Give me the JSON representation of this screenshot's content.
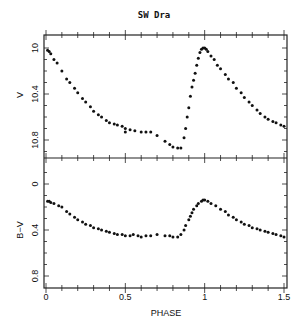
{
  "chart_data": [
    {
      "type": "scatter",
      "title": "SW Dra",
      "xlabel": "PHASE",
      "ylabel": "V",
      "xlim": [
        0,
        1.5
      ],
      "ylim": [
        10.9,
        9.95
      ],
      "y_inverted": true,
      "xticks": [
        "0",
        "0.5",
        "1",
        "1.5"
      ],
      "yticks": [
        "10",
        "10.4",
        "10.8"
      ],
      "grid": false,
      "series": [
        {
          "name": "V",
          "x": [
            0.01,
            0.02,
            0.03,
            0.05,
            0.07,
            0.1,
            0.13,
            0.15,
            0.18,
            0.2,
            0.23,
            0.25,
            0.28,
            0.3,
            0.33,
            0.35,
            0.38,
            0.4,
            0.43,
            0.45,
            0.48,
            0.5,
            0.5,
            0.53,
            0.56,
            0.6,
            0.63,
            0.66,
            0.7,
            0.75,
            0.78,
            0.8,
            0.83,
            0.85,
            0.87,
            0.88,
            0.89,
            0.9,
            0.91,
            0.92,
            0.93,
            0.94,
            0.95,
            0.96,
            0.97,
            0.98,
            0.99,
            1.0,
            1.01,
            1.02,
            1.04,
            1.06,
            1.08,
            1.1,
            1.13,
            1.15,
            1.18,
            1.2,
            1.23,
            1.25,
            1.28,
            1.3,
            1.33,
            1.35,
            1.38,
            1.4,
            1.43,
            1.45,
            1.48,
            1.5
          ],
          "y": [
            10.02,
            10.03,
            10.05,
            10.1,
            10.13,
            10.2,
            10.27,
            10.3,
            10.35,
            10.39,
            10.44,
            10.47,
            10.51,
            10.55,
            10.58,
            10.6,
            10.63,
            10.65,
            10.66,
            10.67,
            10.68,
            10.7,
            10.73,
            10.71,
            10.72,
            10.73,
            10.73,
            10.73,
            10.76,
            10.81,
            10.84,
            10.86,
            10.87,
            10.87,
            10.78,
            10.7,
            10.6,
            10.52,
            10.42,
            10.34,
            10.28,
            10.22,
            10.15,
            10.09,
            10.04,
            10.01,
            10.0,
            10.0,
            10.01,
            10.03,
            10.07,
            10.1,
            10.15,
            10.18,
            10.23,
            10.27,
            10.3,
            10.35,
            10.39,
            10.43,
            10.47,
            10.5,
            10.54,
            10.57,
            10.6,
            10.62,
            10.64,
            10.65,
            10.67,
            10.68
          ]
        }
      ]
    },
    {
      "type": "scatter",
      "xlabel": "PHASE",
      "ylabel": "B−V",
      "xlim": [
        0,
        1.5
      ],
      "ylim": [
        0.85,
        -0.15
      ],
      "y_inverted": true,
      "xticks": [
        "0",
        "0.5",
        "1",
        "1.5"
      ],
      "yticks": [
        "0",
        "0.4",
        "0.8"
      ],
      "grid": false,
      "series": [
        {
          "name": "B-V",
          "x": [
            0.01,
            0.02,
            0.03,
            0.05,
            0.08,
            0.1,
            0.13,
            0.15,
            0.18,
            0.2,
            0.23,
            0.25,
            0.28,
            0.3,
            0.33,
            0.35,
            0.38,
            0.4,
            0.43,
            0.45,
            0.48,
            0.5,
            0.53,
            0.55,
            0.58,
            0.6,
            0.63,
            0.66,
            0.7,
            0.75,
            0.78,
            0.8,
            0.83,
            0.85,
            0.87,
            0.88,
            0.9,
            0.91,
            0.92,
            0.93,
            0.95,
            0.96,
            0.98,
            0.99,
            1.0,
            1.02,
            1.04,
            1.07,
            1.1,
            1.13,
            1.15,
            1.18,
            1.2,
            1.23,
            1.25,
            1.28,
            1.3,
            1.33,
            1.35,
            1.38,
            1.4,
            1.43,
            1.45,
            1.48,
            1.5
          ],
          "y": [
            0.15,
            0.15,
            0.16,
            0.17,
            0.19,
            0.2,
            0.24,
            0.26,
            0.29,
            0.31,
            0.33,
            0.35,
            0.36,
            0.38,
            0.39,
            0.4,
            0.41,
            0.42,
            0.43,
            0.44,
            0.44,
            0.45,
            0.45,
            0.44,
            0.45,
            0.46,
            0.45,
            0.45,
            0.44,
            0.45,
            0.45,
            0.46,
            0.46,
            0.44,
            0.4,
            0.36,
            0.31,
            0.28,
            0.25,
            0.22,
            0.19,
            0.17,
            0.15,
            0.14,
            0.14,
            0.15,
            0.17,
            0.19,
            0.22,
            0.24,
            0.27,
            0.29,
            0.31,
            0.33,
            0.35,
            0.36,
            0.38,
            0.39,
            0.4,
            0.41,
            0.42,
            0.43,
            0.44,
            0.45,
            0.46
          ]
        }
      ]
    }
  ],
  "labels": {
    "title": "SW Dra",
    "xlabel": "PHASE",
    "top_ylabel": "V",
    "bottom_ylabel": "B−V",
    "xticks": [
      "0",
      "0.5",
      "1",
      "1.5"
    ],
    "top_yticks": [
      "10",
      "10.4",
      "10.8"
    ],
    "bottom_yticks": [
      "0",
      "0.4",
      "0.8"
    ]
  }
}
